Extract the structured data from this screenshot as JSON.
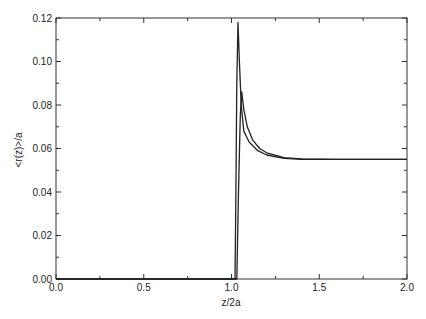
{
  "chart_data": {
    "type": "line",
    "title": "",
    "xlabel": "z/2a",
    "ylabel": "<r(z)>/a",
    "xlim": [
      0.0,
      2.0
    ],
    "ylim": [
      0.0,
      0.12
    ],
    "grid": false,
    "legend": null,
    "x_ticks": [
      "0.0",
      "0.5",
      "1.0",
      "1.5",
      "2.0"
    ],
    "y_ticks": [
      "0.00",
      "0.02",
      "0.04",
      "0.06",
      "0.08",
      "0.10",
      "0.12"
    ],
    "series": [
      {
        "name": "sharp-peak curve",
        "x": [
          0.0,
          1.02,
          1.025,
          1.03,
          1.037,
          1.045,
          1.055,
          1.07,
          1.1,
          1.15,
          1.2,
          1.3,
          1.4,
          1.6,
          1.8,
          2.0
        ],
        "y": [
          0.0,
          0.0,
          0.04,
          0.09,
          0.118,
          0.1,
          0.08,
          0.068,
          0.063,
          0.059,
          0.057,
          0.0555,
          0.055,
          0.055,
          0.055,
          0.055
        ]
      },
      {
        "name": "lower-peak curve",
        "x": [
          0.0,
          1.03,
          1.04,
          1.05,
          1.058,
          1.07,
          1.09,
          1.12,
          1.16,
          1.2,
          1.3,
          1.4,
          1.6,
          1.8,
          2.0
        ],
        "y": [
          0.0,
          0.0,
          0.04,
          0.075,
          0.086,
          0.078,
          0.07,
          0.064,
          0.06,
          0.058,
          0.0558,
          0.0552,
          0.055,
          0.055,
          0.055
        ]
      }
    ]
  },
  "axes": {
    "xlabel": "z/2a",
    "ylabel": "<r(z)>/a",
    "x_ticks": [
      "0.0",
      "0.5",
      "1.0",
      "1.5",
      "2.0"
    ],
    "y_ticks": [
      "0.00",
      "0.02",
      "0.04",
      "0.06",
      "0.08",
      "0.10",
      "0.12"
    ]
  }
}
